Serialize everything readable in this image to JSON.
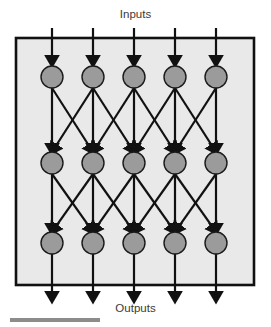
{
  "figure": {
    "type": "neural-network-diagram",
    "title_top": "Inputs",
    "title_bottom": "Outputs",
    "canvas": {
      "width": 271,
      "height": 327,
      "background": "#ffffff"
    }
  },
  "panel": {
    "x": 16,
    "y": 38,
    "width": 238,
    "height": 247,
    "fill": "#e9e9e9",
    "stroke": "#111111",
    "stroke_width": 2.6
  },
  "nodes": {
    "columns_x": [
      52,
      93,
      134,
      175,
      216
    ],
    "rows_y": [
      77,
      163,
      243
    ],
    "radius": 11,
    "fill": "#9b9b9b",
    "stroke": "#1a1a1a",
    "stroke_width": 1.4,
    "row_labels": [
      "input-layer",
      "hidden-layer",
      "output-layer"
    ],
    "count_per_row": 5,
    "total": 15
  },
  "edges": {
    "pattern": "self-and-nearest-neighbors",
    "description": "each node connects straight down to the node below and diagonally to its immediate left and right neighbors",
    "stroke": "#111111",
    "stroke_width": 2.2,
    "arrowhead": "filled-triangle"
  },
  "input_arrows": {
    "start_y": 28,
    "end_y": 64,
    "count": 5
  },
  "output_arrows": {
    "start_y": 254,
    "end_y": 300,
    "count": 5
  },
  "scale_bar": {
    "x": 10,
    "y": 318,
    "width": 90,
    "height": 4,
    "fill": "#8c8c8c"
  },
  "chart_data": {
    "type": "diagram",
    "layers": [
      {
        "name": "input-layer",
        "nodes": 5,
        "y": 77
      },
      {
        "name": "hidden-layer",
        "nodes": 5,
        "y": 163
      },
      {
        "name": "output-layer",
        "nodes": 5,
        "y": 243
      }
    ],
    "connections_between_layers": "node i connects to nodes i-1, i, i+1 in the next layer"
  }
}
